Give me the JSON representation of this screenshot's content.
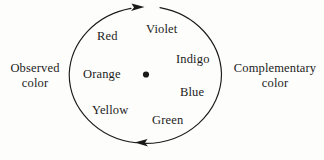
{
  "figure": {
    "type": "color-wheel-diagram",
    "background_color": "#fdfdfb",
    "stroke_color": "#1a1a1a"
  },
  "wheel": {
    "center_dot_name": "center-dot",
    "colors": [
      {
        "id": "violet",
        "label": "Violet"
      },
      {
        "id": "indigo",
        "label": "Indigo"
      },
      {
        "id": "blue",
        "label": "Blue"
      },
      {
        "id": "green",
        "label": "Green"
      },
      {
        "id": "yellow",
        "label": "Yellow"
      },
      {
        "id": "orange",
        "label": "Orange"
      },
      {
        "id": "red",
        "label": "Red"
      }
    ],
    "arrows": [
      {
        "id": "top-arrow",
        "direction": "right"
      },
      {
        "id": "bottom-arrow",
        "direction": "left"
      }
    ]
  },
  "side_labels": {
    "left": {
      "line1": "Observed",
      "line2": "color"
    },
    "right": {
      "line1": "Complementary",
      "line2": "color"
    }
  }
}
